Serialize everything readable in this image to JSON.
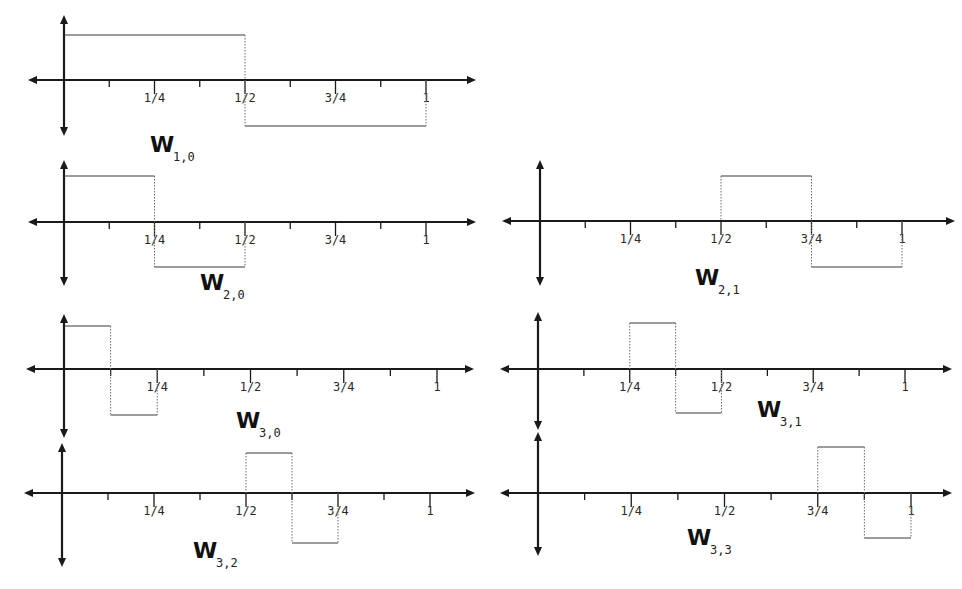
{
  "figure": {
    "tick_labels": [
      "1/4",
      "1/2",
      "3/4",
      "1"
    ],
    "panels": [
      {
        "id": "w-1-0",
        "label_main": "W",
        "label_sub": "1,0",
        "scale": 1,
        "shift": 0,
        "support": [
          0,
          0.5,
          1
        ],
        "geom": {
          "x0": 64,
          "x1": 426,
          "yaxis": 80,
          "ytop": 15,
          "ybot": 136,
          "left": 28,
          "right": 476,
          "hi": 35,
          "lo": 126,
          "lx": 150,
          "ly": 152
        }
      },
      {
        "id": "w-2-0",
        "label_main": "W",
        "label_sub": "2,0",
        "scale": 2,
        "shift": 0,
        "support": [
          0,
          0.25,
          0.5
        ],
        "geom": {
          "x0": 64,
          "x1": 426,
          "yaxis": 222,
          "ytop": 160,
          "ybot": 286,
          "left": 28,
          "right": 476,
          "hi": 176,
          "lo": 267,
          "lx": 200,
          "ly": 290
        }
      },
      {
        "id": "w-2-1",
        "label_main": "W",
        "label_sub": "2,1",
        "scale": 2,
        "shift": 1,
        "support": [
          0.5,
          0.75,
          1
        ],
        "geom": {
          "x0": 540,
          "x1": 902,
          "yaxis": 221,
          "ytop": 160,
          "ybot": 286,
          "left": 502,
          "right": 955,
          "hi": 176,
          "lo": 267,
          "lx": 695,
          "ly": 285
        }
      },
      {
        "id": "w-3-0",
        "label_main": "W",
        "label_sub": "3,0",
        "scale": 3,
        "shift": 0,
        "support": [
          0,
          0.125,
          0.25
        ],
        "geom": {
          "x0": 64,
          "x1": 437,
          "yaxis": 369,
          "ytop": 314,
          "ybot": 438,
          "left": 26,
          "right": 474,
          "hi": 326,
          "lo": 415,
          "lx": 236,
          "ly": 428
        }
      },
      {
        "id": "w-3-1",
        "label_main": "W",
        "label_sub": "3,1",
        "scale": 3,
        "shift": 1,
        "support": [
          0.25,
          0.375,
          0.5
        ],
        "geom": {
          "x0": 538,
          "x1": 905,
          "yaxis": 369,
          "ytop": 312,
          "ybot": 430,
          "left": 500,
          "right": 952,
          "hi": 323,
          "lo": 413,
          "lx": 757,
          "ly": 417
        }
      },
      {
        "id": "w-3-2",
        "label_main": "W",
        "label_sub": "3,2",
        "scale": 3,
        "shift": 2,
        "support": [
          0.5,
          0.625,
          0.75
        ],
        "geom": {
          "x0": 62,
          "x1": 430,
          "yaxis": 493,
          "ytop": 443,
          "ybot": 567,
          "left": 24,
          "right": 475,
          "hi": 453,
          "lo": 543,
          "lx": 193,
          "ly": 558
        }
      },
      {
        "id": "w-3-3",
        "label_main": "W",
        "label_sub": "3,3",
        "scale": 3,
        "shift": 3,
        "support": [
          0.75,
          0.875,
          1
        ],
        "geom": {
          "x0": 538,
          "x1": 911,
          "yaxis": 493,
          "ytop": 432,
          "ybot": 556,
          "left": 500,
          "right": 952,
          "hi": 447,
          "lo": 538,
          "lx": 687,
          "ly": 545
        }
      }
    ]
  }
}
